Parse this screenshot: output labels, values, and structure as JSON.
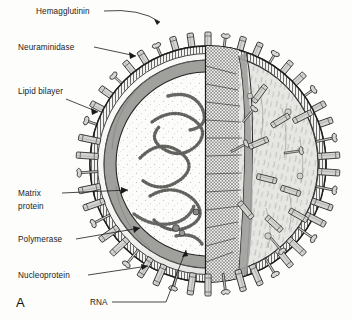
{
  "figure": {
    "panel_letter": "A",
    "background_color": "#fdfdfc",
    "ink_color": "#1a1a1a",
    "membrane_color": "#9a9a9a",
    "interior_color": "#fbfbfa",
    "spike_color": "#d2d2d0",
    "surface_color": "#e3e3e0"
  },
  "labels": [
    {
      "id": "hemagglutinin",
      "text": "Hemagglutinin",
      "x": 36,
      "y": 14
    },
    {
      "id": "neuraminidase",
      "text": "Neuraminidase",
      "x": 18,
      "y": 50
    },
    {
      "id": "lipid-bilayer",
      "text": "Lipid bilayer",
      "x": 18,
      "y": 94
    },
    {
      "id": "matrix-protein-line1",
      "text": "Matrix",
      "x": 18,
      "y": 196
    },
    {
      "id": "matrix-protein-line2",
      "text": "protein",
      "x": 18,
      "y": 209
    },
    {
      "id": "polymerase",
      "text": "Polymerase",
      "x": 18,
      "y": 242
    },
    {
      "id": "nucleoprotein",
      "text": "Nucleoprotein",
      "x": 18,
      "y": 278
    },
    {
      "id": "rna",
      "text": "RNA",
      "x": 90,
      "y": 305
    }
  ],
  "structures": [
    {
      "id": "hemagglutinin-spike",
      "name": "Hemagglutinin spike"
    },
    {
      "id": "neuraminidase-spike",
      "name": "Neuraminidase spike"
    },
    {
      "id": "lipid-bilayer-envelope",
      "name": "Lipid bilayer envelope"
    },
    {
      "id": "matrix-protein-layer",
      "name": "Matrix protein layer"
    },
    {
      "id": "polymerase-complex",
      "name": "Polymerase"
    },
    {
      "id": "nucleoprotein-strand",
      "name": "Nucleoprotein"
    },
    {
      "id": "rna-segment",
      "name": "RNA segment"
    },
    {
      "id": "cutaway-plane",
      "name": "Cutaway cross-section plane"
    }
  ]
}
